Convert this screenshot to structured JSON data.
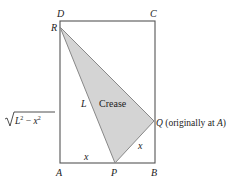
{
  "figure": {
    "type": "geometry-diagram",
    "colors": {
      "background": "#ffffff",
      "rectangle_stroke": "#555555",
      "triangle_fill": "#d4d4d4",
      "triangle_stroke": "#888888",
      "text": "#222222"
    },
    "vertices": {
      "D": "D",
      "C": "C",
      "R": "R",
      "A": "A",
      "P": "P",
      "B": "B",
      "Q": "Q"
    },
    "labels": {
      "crease": "Crease",
      "L": "L",
      "x_bottom": "x",
      "x_slant": "x",
      "left_side_sqrt_body": "L",
      "left_side_sup1": "2",
      "left_side_minus": " − ",
      "left_side_x": "x",
      "left_side_sup2": "2",
      "q_note_prefix": " (originally at ",
      "q_note_A": "A",
      "q_note_suffix": ")"
    }
  }
}
